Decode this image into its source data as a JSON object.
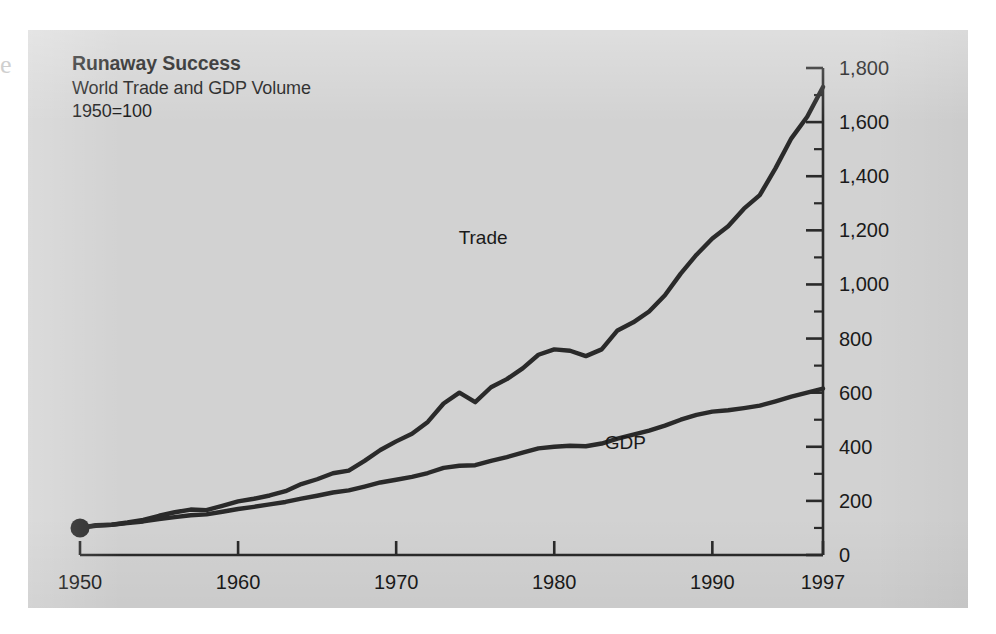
{
  "figure": {
    "background_color": "#d2d2d2",
    "page_color": "#ffffff",
    "ink_color": "#2a2a2a",
    "bleed_glyph": "e"
  },
  "title": "Runaway Success",
  "subtitle": "World Trade and GDP Volume",
  "basis_note": "1950=100",
  "chart_data": {
    "type": "line",
    "title": "Runaway Success",
    "subtitle": "World Trade and GDP Volume",
    "note": "1950=100",
    "xlabel": "",
    "ylabel": "",
    "xlim": [
      1950,
      1997
    ],
    "ylim": [
      0,
      1800
    ],
    "y_axis_position": "right",
    "grid": false,
    "legend": "inline-labels",
    "y_major_step": 200,
    "y_minor_step": 100,
    "y_ticks": [
      0,
      200,
      400,
      600,
      800,
      1000,
      1200,
      1400,
      1600,
      1800
    ],
    "y_tick_labels": [
      "0",
      "200",
      "400",
      "600",
      "800",
      "1,000",
      "1,200",
      "1,400",
      "1,600",
      "1,800"
    ],
    "x_ticks": [
      1950,
      1960,
      1970,
      1980,
      1990,
      1997
    ],
    "x_tick_labels": [
      "1950",
      "1960",
      "1970",
      "1980",
      "1990",
      "1997"
    ],
    "origin_marker": {
      "x": 1950,
      "y": 100,
      "label": ""
    },
    "series": [
      {
        "name": "Trade",
        "label": "Trade",
        "color": "#2a2a2a",
        "label_x": 1975.5,
        "label_y": 1150,
        "x": [
          1950,
          1951,
          1952,
          1953,
          1954,
          1955,
          1956,
          1957,
          1958,
          1959,
          1960,
          1961,
          1962,
          1963,
          1964,
          1965,
          1966,
          1967,
          1968,
          1969,
          1970,
          1971,
          1972,
          1973,
          1974,
          1975,
          1976,
          1977,
          1978,
          1979,
          1980,
          1981,
          1982,
          1983,
          1984,
          1985,
          1986,
          1987,
          1988,
          1989,
          1990,
          1991,
          1992,
          1993,
          1994,
          1995,
          1996,
          1997
        ],
        "values": [
          100,
          110,
          112,
          120,
          130,
          145,
          158,
          168,
          166,
          182,
          198,
          208,
          220,
          236,
          262,
          280,
          302,
          312,
          348,
          388,
          420,
          448,
          492,
          560,
          600,
          565,
          620,
          650,
          690,
          740,
          760,
          755,
          735,
          760,
          830,
          860,
          900,
          960,
          1040,
          1110,
          1170,
          1215,
          1280,
          1330,
          1430,
          1540,
          1620,
          1730
        ]
      },
      {
        "name": "GDP",
        "label": "GDP",
        "color": "#2a2a2a",
        "label_x": 1984.5,
        "label_y": 390,
        "x": [
          1950,
          1951,
          1952,
          1953,
          1954,
          1955,
          1956,
          1957,
          1958,
          1959,
          1960,
          1961,
          1962,
          1963,
          1964,
          1965,
          1966,
          1967,
          1968,
          1969,
          1970,
          1971,
          1972,
          1973,
          1974,
          1975,
          1976,
          1977,
          1978,
          1979,
          1980,
          1981,
          1982,
          1983,
          1984,
          1985,
          1986,
          1987,
          1988,
          1989,
          1990,
          1991,
          1992,
          1993,
          1994,
          1995,
          1996,
          1997
        ],
        "values": [
          100,
          108,
          112,
          118,
          124,
          133,
          140,
          147,
          150,
          160,
          170,
          178,
          187,
          196,
          208,
          219,
          231,
          239,
          253,
          268,
          278,
          289,
          303,
          322,
          330,
          332,
          348,
          362,
          378,
          394,
          400,
          404,
          402,
          412,
          430,
          445,
          460,
          478,
          500,
          518,
          530,
          535,
          543,
          552,
          568,
          585,
          600,
          615
        ]
      }
    ]
  }
}
